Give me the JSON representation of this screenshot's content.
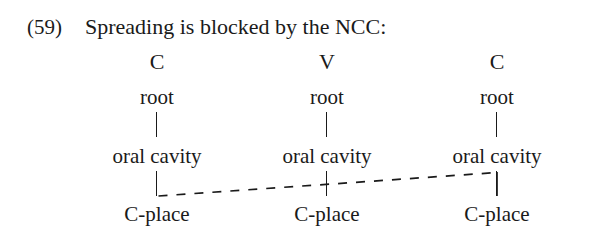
{
  "header": {
    "number": "(59)",
    "text": "Spreading is blocked by the NCC:"
  },
  "colors": {
    "background": "#ffffff",
    "ink": "#1a1a1a"
  },
  "diagram": {
    "type": "autosegmental-feature-tree",
    "tier_labels": [
      "segment",
      "root",
      "oral cavity",
      "C-place"
    ],
    "columns": [
      {
        "segment": "C",
        "root": "root",
        "oral_cavity": "oral cavity",
        "c_place": "C-place"
      },
      {
        "segment": "V",
        "root": "root",
        "oral_cavity": "oral cavity",
        "c_place": "C-place"
      },
      {
        "segment": "C",
        "root": "root",
        "oral_cavity": "oral cavity",
        "c_place": "C-place"
      }
    ],
    "association_lines": {
      "solid_vertical": "root-to-oral-cavity and oral-cavity-to-C-place in each of the three columns",
      "dashed_spreading": "dashed horizontal line from column 1 C-place corner rightward across column 2 vertical line to column 3 C-place corner, representing blocked spreading"
    }
  }
}
